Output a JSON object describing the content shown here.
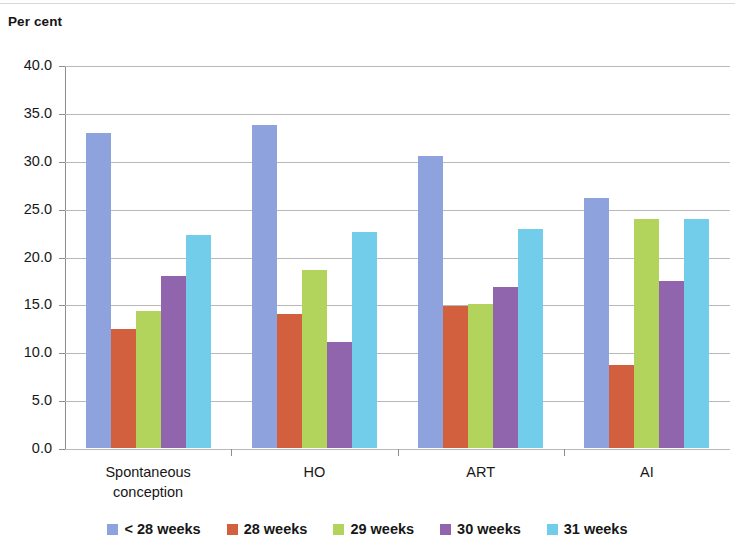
{
  "header": {
    "axis_title": "Per cent"
  },
  "chart_data": {
    "type": "bar",
    "title": "",
    "subtitle": "",
    "xlabel": "",
    "ylabel": "Per cent",
    "ylim": [
      0,
      40
    ],
    "ytick_labels": [
      "0.0",
      "5.0",
      "10.0",
      "15.0",
      "20.0",
      "25.0",
      "30.0",
      "35.0",
      "40.0"
    ],
    "ytick_values": [
      0,
      5,
      10,
      15,
      20,
      25,
      30,
      35,
      40
    ],
    "grid": true,
    "legend_position": "bottom",
    "categories": [
      "Spontaneous conception",
      "HO",
      "ART",
      "AI"
    ],
    "category_lines": [
      [
        "Spontaneous",
        "conception"
      ],
      [
        "HO"
      ],
      [
        "ART"
      ],
      [
        "AI"
      ]
    ],
    "series": [
      {
        "name": "< 28 weeks",
        "color": "#8EA2DE",
        "values": [
          32.9,
          33.7,
          30.5,
          26.1
        ]
      },
      {
        "name": "28 weeks",
        "color": "#D2603F",
        "values": [
          12.4,
          14.0,
          14.8,
          8.7
        ]
      },
      {
        "name": "29 weeks",
        "color": "#B3D45C",
        "values": [
          14.3,
          18.6,
          15.0,
          23.9
        ]
      },
      {
        "name": "30 weeks",
        "color": "#9164AE",
        "values": [
          18.0,
          11.1,
          16.8,
          17.4
        ]
      },
      {
        "name": "31 weeks",
        "color": "#72CDEB",
        "values": [
          22.2,
          22.6,
          22.9,
          23.9
        ]
      }
    ]
  }
}
